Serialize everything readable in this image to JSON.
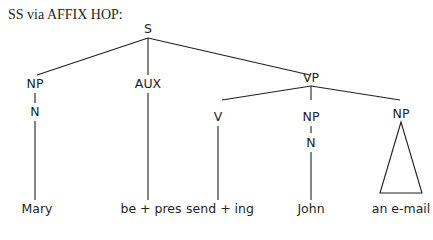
{
  "title": "SS via AFFIX HOP:",
  "tree": {
    "root": "S",
    "nodes": {
      "s": "S",
      "np_subj": "NP",
      "n_subj": "N",
      "aux": "AUX",
      "vp": "VP",
      "v": "V",
      "np_obj1": "NP",
      "n_obj1": "N",
      "np_obj2": "NP"
    },
    "leaves": {
      "mary": "Mary",
      "be_pres": "be + pres",
      "send_ing": "send + ing",
      "john": "John",
      "email": "an e-mail"
    }
  },
  "colors": {
    "ink": "#231f20",
    "background": "#ffffff"
  }
}
